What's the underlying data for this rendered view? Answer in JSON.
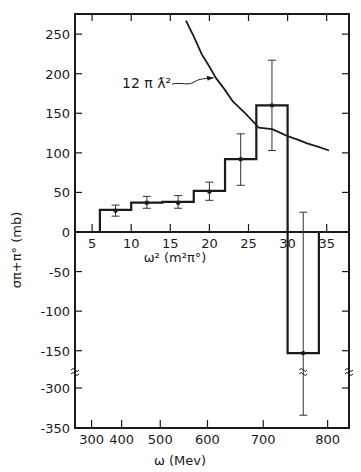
{
  "chart_data": {
    "type": "bar",
    "subtype": "histogram-with-error-bars-and-curve",
    "title": "",
    "ylabel": "σπ+π° (mb)",
    "xlabel_primary": "ω² (m²π°)",
    "xlabel_secondary": "ω (Mev)",
    "ylim": [
      -350,
      270
    ],
    "y_axis_break": {
      "between": [
        -150,
        -300
      ]
    },
    "y_ticks": [
      250,
      200,
      150,
      100,
      50,
      0,
      -50,
      -100,
      -150,
      -300,
      -350
    ],
    "y_tick_labels": [
      "250",
      "200",
      "150",
      "100",
      "50",
      "0",
      "-50",
      "-100",
      "-150",
      "-300",
      "-350"
    ],
    "x_ticks_primary": [
      5,
      10,
      15,
      20,
      25,
      30,
      35
    ],
    "x_tick_labels_primary": [
      "5",
      "10",
      "15",
      "20",
      "25",
      "30",
      "35"
    ],
    "x_ticks_secondary": [
      300,
      400,
      500,
      600,
      700,
      800
    ],
    "x_tick_labels_secondary": [
      "300",
      "400",
      "500",
      "600",
      "700",
      "800"
    ],
    "grid": false,
    "bins": [
      {
        "x_range": [
          6,
          10
        ],
        "value": 28,
        "point_x": 8,
        "point_y": 27,
        "err_low": 20,
        "err_high": 34
      },
      {
        "x_range": [
          10,
          14
        ],
        "value": 37,
        "point_x": 12,
        "point_y": 37,
        "err_low": 30,
        "err_high": 45
      },
      {
        "x_range": [
          14,
          18
        ],
        "value": 38,
        "point_x": 16,
        "point_y": 37,
        "err_low": 30,
        "err_high": 46
      },
      {
        "x_range": [
          18,
          22
        ],
        "value": 52,
        "point_x": 20,
        "point_y": 51,
        "err_low": 40,
        "err_high": 63
      },
      {
        "x_range": [
          22,
          26
        ],
        "value": 92,
        "point_x": 24,
        "point_y": 92,
        "err_low": 59,
        "err_high": 124
      },
      {
        "x_range": [
          26,
          30
        ],
        "value": 160,
        "point_x": 28,
        "point_y": 160,
        "err_low": 103,
        "err_high": 217
      },
      {
        "x_range": [
          30,
          34
        ],
        "value": -153,
        "point_x": 32,
        "point_y": -153,
        "err_low": -334,
        "err_high": 25
      }
    ],
    "curve": {
      "label": "12 π ƛ²",
      "points": [
        [
          17,
          267
        ],
        [
          19,
          225
        ],
        [
          20.8,
          195
        ],
        [
          23,
          165
        ],
        [
          26.3,
          132
        ],
        [
          28,
          130
        ],
        [
          30,
          121
        ],
        [
          32.5,
          112
        ],
        [
          35.3,
          103
        ]
      ]
    },
    "annotations": [
      {
        "text": "12 π ƛ²",
        "arrow_to": [
          20.8,
          195
        ]
      }
    ]
  }
}
